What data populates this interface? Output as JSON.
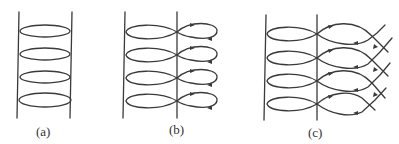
{
  "figure": {
    "panels": [
      {
        "id": "a",
        "label": "(a)",
        "description": "Two vertical boundary lines with four closed elliptical loops between them"
      },
      {
        "id": "b",
        "label": "(b)",
        "description": "Four elliptical loops between lines, each pinched at the right line into a small closed loop with direction arrows"
      },
      {
        "id": "c",
        "label": "(c)",
        "description": "Four elliptical loops between lines, with open lens-shaped arcs on the right crossing diagonal lines, with direction arrows"
      }
    ],
    "colors": {
      "stroke": "#3a3a3a",
      "background": "#ffffff"
    }
  }
}
